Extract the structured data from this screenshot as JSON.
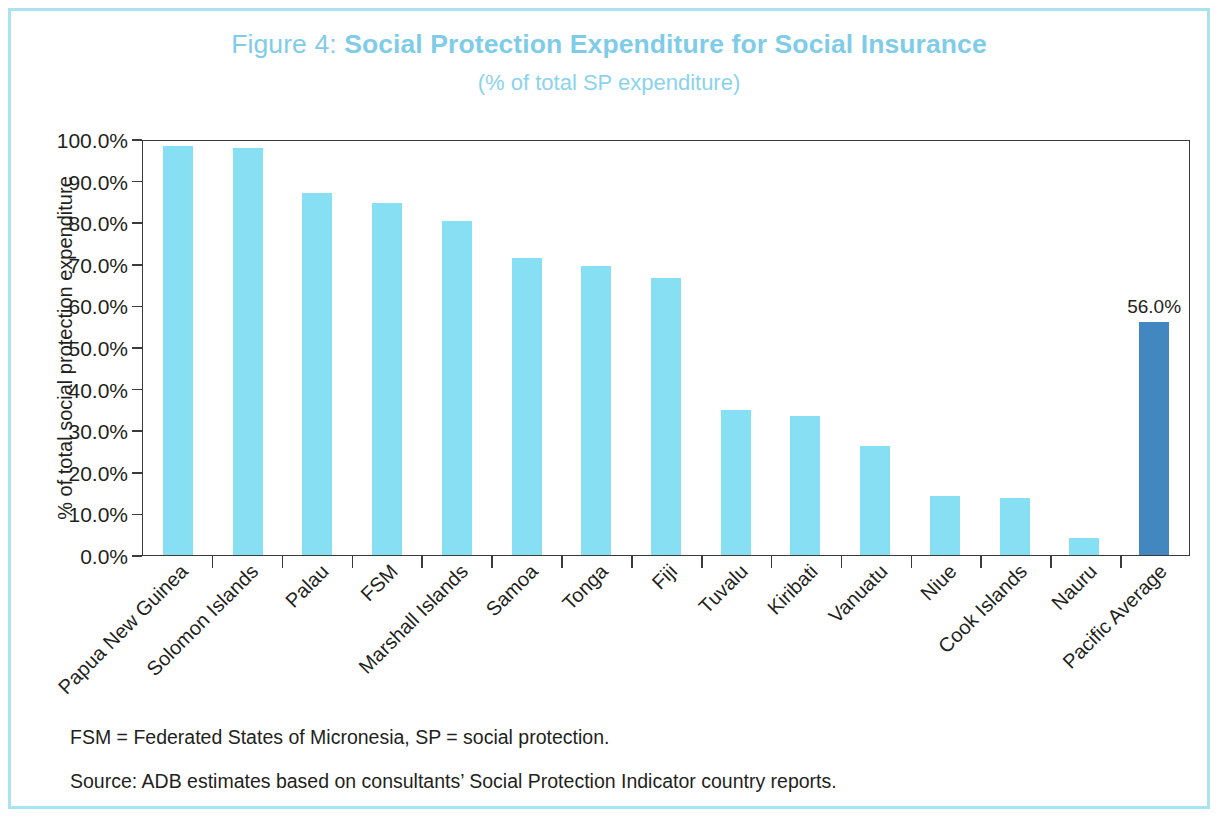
{
  "figure": {
    "title_lead": "Figure 4:",
    "title_main": "Social Protection Expenditure for Social Insurance",
    "subtitle": "(% of total SP expenditure)"
  },
  "notes": {
    "abbreviations": "FSM = Federated States of Micronesia, SP = social protection.",
    "source": "Source: ADB estimates based on consultants’ Social Protection Indicator country reports."
  },
  "colors": {
    "bar": "#86DFF2",
    "bar_accent": "#4287BF",
    "title": "#7FCCE9",
    "subtitle": "#8BD3EC",
    "frame": "#A9E3F2",
    "axis": "#3b3b3b",
    "text": "#231f20"
  },
  "chart_data": {
    "type": "bar",
    "title": "Figure 4: Social Protection Expenditure for Social Insurance",
    "subtitle": "(% of total SP expenditure)",
    "xlabel": "",
    "ylabel": "% of total social protection expenditure",
    "ylim": [
      0,
      100
    ],
    "yticks": [
      0,
      10,
      20,
      30,
      40,
      50,
      60,
      70,
      80,
      90,
      100
    ],
    "ytick_labels": [
      "0.0%",
      "10.0%",
      "20.0%",
      "30.0%",
      "40.0%",
      "50.0%",
      "60.0%",
      "70.0%",
      "80.0%",
      "90.0%",
      "100.0%"
    ],
    "grid": false,
    "legend": null,
    "value_unit": "%",
    "categories": [
      "Papua New Guinea",
      "Solomon Islands",
      "Palau",
      "FSM",
      "Marshall Islands",
      "Samoa",
      "Tonga",
      "Fiji",
      "Tuvalu",
      "Kiribati",
      "Vanuatu",
      "Niue",
      "Cook Islands",
      "Nauru",
      "Pacific Average"
    ],
    "values": [
      98.4,
      97.8,
      87.1,
      84.5,
      80.4,
      71.3,
      69.4,
      66.5,
      34.8,
      33.5,
      26.3,
      14.3,
      13.6,
      4.2,
      56.0
    ],
    "accent_index": 14,
    "data_labels": {
      "14": "56.0%"
    }
  }
}
